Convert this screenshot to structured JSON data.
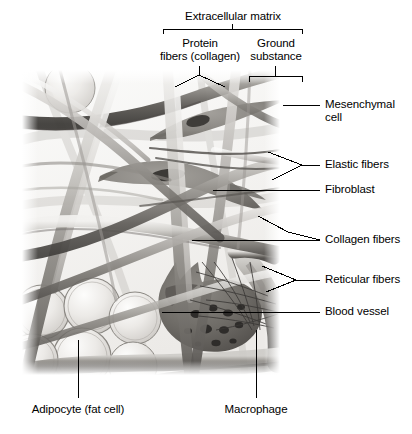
{
  "figure": {
    "style": "grayscale pencil illustration",
    "background_color": "#ffffff",
    "leader_line_color": "#000000"
  },
  "bracket_labels": {
    "top_title": "Extracellular matrix",
    "left_branch": {
      "line1": "Protein",
      "line2": "fibers (collagen)"
    },
    "right_branch": {
      "line1": "Ground",
      "line2": "substance"
    }
  },
  "right_labels": [
    {
      "id": "mesenchymal-cell",
      "line1": "Mesenchymal",
      "line2": "cell"
    },
    {
      "id": "elastic-fibers",
      "line1": "Elastic fibers",
      "line2": ""
    },
    {
      "id": "fibroblast",
      "line1": "Fibroblast",
      "line2": ""
    },
    {
      "id": "collagen-fibers",
      "line1": "Collagen fibers",
      "line2": ""
    },
    {
      "id": "reticular-fibers",
      "line1": "Reticular fibers",
      "line2": ""
    },
    {
      "id": "blood-vessel",
      "line1": "Blood vessel",
      "line2": ""
    }
  ],
  "bottom_labels": [
    {
      "id": "adipocyte",
      "text": "Adipocyte (fat cell)"
    },
    {
      "id": "macrophage",
      "text": "Macrophage"
    }
  ]
}
